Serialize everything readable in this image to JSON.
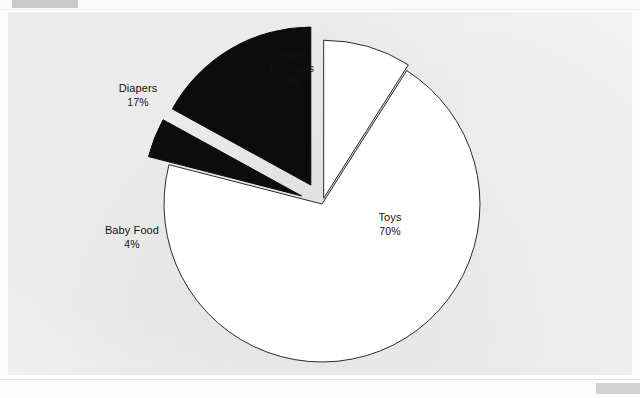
{
  "page": {
    "background_color": "#fdfdfd",
    "plate_color": "#f2f2f2"
  },
  "header": {
    "gray_bar_color": "#c9c9c9",
    "faint_text": "",
    "rule_color": "#ededed"
  },
  "footer": {
    "gray_bar_color": "#d2d2d2",
    "rule_color": "#e4e4e4"
  },
  "chart_data": {
    "type": "pie",
    "title": "",
    "subtitle": "",
    "xlabel": "",
    "ylabel": "",
    "legend_position": "none",
    "grid": false,
    "units": "percent",
    "start_angle_deg": 0,
    "direction": "clockwise",
    "center": {
      "x": 322,
      "y": 204
    },
    "radius": 158,
    "outline_color": "#2b2b2b",
    "categories": [
      "Infant Products",
      "Toys",
      "Baby Food",
      "Diapers"
    ],
    "values": [
      9,
      70,
      4,
      17
    ],
    "slices": [
      {
        "name": "Infant Products",
        "label": "Infant\nProducts",
        "value": 9,
        "value_label": "9%",
        "color": "#ffffff",
        "outline": "#2b2b2b",
        "exploded": true,
        "explode_offset": 6,
        "label_x": 246,
        "label_y": 48,
        "label_width": 92
      },
      {
        "name": "Toys",
        "label": "Toys",
        "value": 70,
        "value_label": "70%",
        "color": "#ffffff",
        "outline": "#2b2b2b",
        "exploded": false,
        "explode_offset": 0,
        "label_x": 350,
        "label_y": 211,
        "label_width": 80
      },
      {
        "name": "Baby Food",
        "label": "Baby Food",
        "value": 4,
        "value_label": "4%",
        "color": "#0c0c0c",
        "outline": "#0c0c0c",
        "exploded": true,
        "explode_offset": 22,
        "label_x": 84,
        "label_y": 224,
        "label_width": 96
      },
      {
        "name": "Diapers",
        "label": "Diapers",
        "value": 17,
        "value_label": "17%",
        "color": "#0c0c0c",
        "outline": "#0c0c0c",
        "exploded": true,
        "explode_offset": 22,
        "label_x": 92,
        "label_y": 82,
        "label_width": 92
      }
    ]
  }
}
